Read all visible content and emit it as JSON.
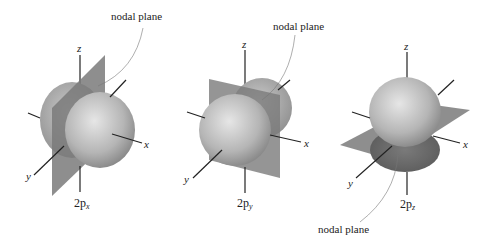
{
  "figure": {
    "panels": [
      {
        "id": "px",
        "orbital_label": "2p",
        "orbital_subscript": "x",
        "nodal_plane_label": "nodal plane",
        "axes": {
          "x": "x",
          "y": "y",
          "z": "z"
        }
      },
      {
        "id": "py",
        "orbital_label": "2p",
        "orbital_subscript": "y",
        "nodal_plane_label": "nodal plane",
        "axes": {
          "x": "x",
          "y": "y",
          "z": "z"
        }
      },
      {
        "id": "pz",
        "orbital_label": "2p",
        "orbital_subscript": "z",
        "nodal_plane_label": "nodal plane",
        "axes": {
          "x": "x",
          "y": "y",
          "z": "z"
        }
      }
    ],
    "colors": {
      "lobe_light": "#d8d8d8",
      "lobe_dark": "#8a8a8a",
      "plane": "#7a7a7a",
      "axis": "#222222"
    }
  }
}
